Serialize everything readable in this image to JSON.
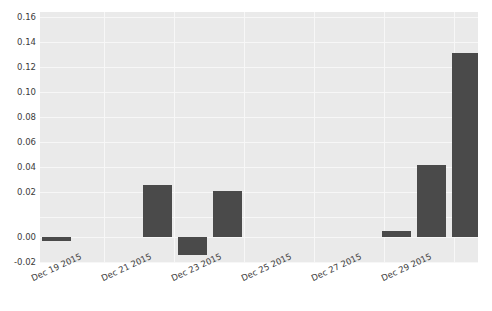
{
  "chart_data": {
    "type": "bar",
    "title": "",
    "xlabel": "",
    "ylabel": "",
    "categories": [
      "Dec 19 2015",
      "Dec 21 2015",
      "Dec 22 2015",
      "Dec 23 2015",
      "Dec 29 2015",
      "Dec 30 2015",
      "Dec 31 2015"
    ],
    "values": [
      -0.003,
      0.042,
      -0.014,
      0.0365,
      0.0045,
      0.058,
      0.147
    ],
    "ylim": [
      -0.0205,
      0.1685
    ],
    "yticks": [
      -0.02,
      0.0,
      0.02,
      0.04,
      0.06,
      0.08,
      0.1,
      0.12,
      0.14,
      0.16
    ],
    "ytick_labels": [
      "-0.02",
      "0.00",
      "0.02",
      "0.04",
      "0.06",
      "0.08",
      "0.10",
      "0.12",
      "0.14",
      "0.16"
    ],
    "xtick_labels": [
      "Dec 19 2015",
      "Dec 21 2015",
      "Dec 23 2015",
      "Dec 25 2015",
      "Dec 27 2015",
      "Dec 29 2015"
    ],
    "grid": true,
    "legend": "none",
    "colors": {
      "bar": "#4a4a4a",
      "plot_background": "#eaeaea",
      "gridline": "#f7f7f7",
      "tick_text": "#3b3b3b",
      "figure_background": "#ffffff"
    }
  },
  "geometry": {
    "plot_left": 40,
    "plot_top": 12,
    "plot_width": 438,
    "plot_height": 251,
    "zero_y": 237,
    "px_per_unit": 1250,
    "bar_width": 29,
    "bar_lefts": [
      42,
      143,
      178,
      213,
      382,
      417,
      452
    ],
    "xtick_x": [
      44,
      145,
      181,
      251,
      321,
      392
    ],
    "gridline_y": [
      17,
      42,
      67,
      92,
      117,
      142,
      162,
      187,
      212,
      237,
      262
    ],
    "gridline_x": [
      104,
      174,
      244,
      314,
      384,
      454
    ]
  }
}
